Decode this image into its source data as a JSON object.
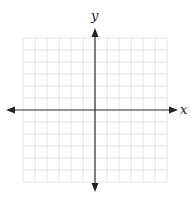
{
  "diagram": {
    "type": "coordinate-plane",
    "x_axis_label": "x",
    "y_axis_label": "y",
    "grid": {
      "columns": 12,
      "rows": 12,
      "cell_size_px": 12,
      "left": 23,
      "top": 38,
      "origin_x": 95,
      "origin_y": 110,
      "line_color": "#e4e4e4",
      "axis_color": "#333333"
    },
    "arrows": [
      "up",
      "down",
      "left",
      "right"
    ]
  }
}
